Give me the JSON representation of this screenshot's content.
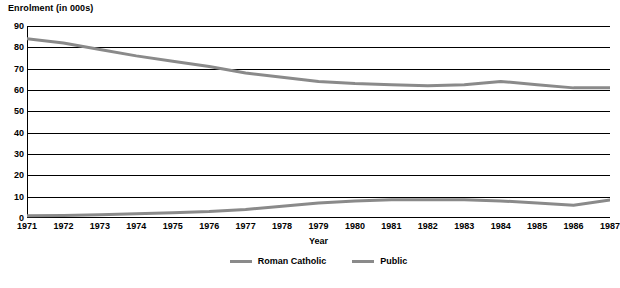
{
  "chart_data": {
    "type": "line",
    "title": "",
    "ylabel": "Enrolment (in 000s)",
    "xlabel": "Year",
    "ylim": [
      0,
      90
    ],
    "yticks": [
      0,
      10,
      20,
      30,
      40,
      50,
      60,
      70,
      80,
      90
    ],
    "grid": true,
    "legend_position": "bottom",
    "categories": [
      "1971",
      "1972",
      "1973",
      "1974",
      "1975",
      "1976",
      "1977",
      "1978",
      "1979",
      "1980",
      "1981",
      "1982",
      "1983",
      "1984",
      "1985",
      "1986",
      "1987"
    ],
    "series": [
      {
        "name": "Roman Catholic",
        "color": "#8a8a8a",
        "values": [
          84,
          82,
          79,
          76,
          73.5,
          71,
          68,
          66,
          64,
          63,
          62.5,
          62,
          62.5,
          64,
          62.5,
          61,
          61
        ]
      },
      {
        "name": "Public",
        "color": "#8a8a8a",
        "values": [
          1,
          1.2,
          1.5,
          2,
          2.5,
          3,
          4,
          5.5,
          7,
          8,
          8.5,
          8.5,
          8.5,
          8,
          7,
          6,
          8.5
        ]
      }
    ]
  },
  "labels": {
    "y_axis_title": "Enrolment (in 000s)",
    "x_axis_title": "Year"
  }
}
